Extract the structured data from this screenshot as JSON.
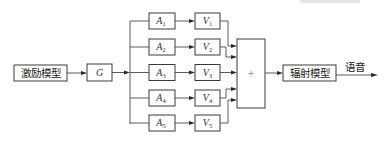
{
  "diagram": {
    "excitation_label": "激励模型",
    "gain_label": "G",
    "summer_label": "+",
    "radiation_label": "辐射模型",
    "output_label": "语音",
    "branches": [
      {
        "a": "A",
        "a_sub": "1",
        "v": "V",
        "v_sub": "1"
      },
      {
        "a": "A",
        "a_sub": "2",
        "v": "V",
        "v_sub": "2"
      },
      {
        "a": "A",
        "a_sub": "3",
        "v": "V",
        "v_sub": "3"
      },
      {
        "a": "A",
        "a_sub": "4",
        "v": "V",
        "v_sub": "4"
      },
      {
        "a": "A",
        "a_sub": "5",
        "v": "V",
        "v_sub": "5"
      }
    ]
  }
}
